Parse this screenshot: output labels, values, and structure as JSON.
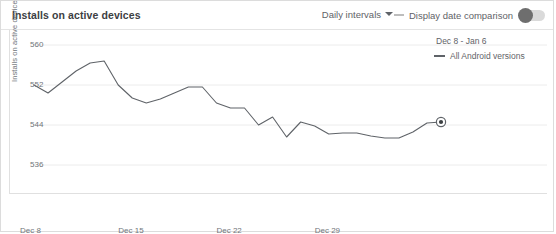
{
  "header": {
    "title": "Installs on active devices",
    "interval_label": "Daily intervals",
    "interval_icon": "chevron-down-icon",
    "comparison_label": "Display date comparison",
    "comparison_toggle_state": "off"
  },
  "legend": {
    "date_range": "Dec 8 - Jan 6",
    "series_label": "All Android versions",
    "series_color": "#5f6368"
  },
  "chart_data": {
    "type": "line",
    "title": "Installs on active devices",
    "xlabel": "",
    "ylabel": "Installs on active devices",
    "ylim": [
      532,
      562
    ],
    "yticks": [
      536,
      544,
      552,
      560
    ],
    "ytick_labels": [
      "536",
      "544",
      "552",
      "560"
    ],
    "xticks": [
      "Dec 8",
      "Dec 15",
      "Dec 22",
      "Dec 29"
    ],
    "xtick_positions": [
      0,
      7,
      14,
      21
    ],
    "grid": true,
    "legend_position": "top-right",
    "line_color": "#5f6368",
    "x": [
      "Dec 8",
      "Dec 9",
      "Dec 10",
      "Dec 11",
      "Dec 12",
      "Dec 13",
      "Dec 14",
      "Dec 15",
      "Dec 16",
      "Dec 17",
      "Dec 18",
      "Dec 19",
      "Dec 20",
      "Dec 21",
      "Dec 22",
      "Dec 23",
      "Dec 24",
      "Dec 25",
      "Dec 26",
      "Dec 27",
      "Dec 28",
      "Dec 29",
      "Dec 30",
      "Dec 31",
      "Jan 1",
      "Jan 2",
      "Jan 3",
      "Jan 4",
      "Jan 5",
      "Jan 6"
    ],
    "series": [
      {
        "name": "All Android versions",
        "values": [
          552.0,
          550.4,
          552.6,
          554.8,
          556.4,
          556.8,
          552.0,
          549.4,
          548.4,
          549.2,
          550.4,
          551.6,
          551.6,
          548.4,
          547.4,
          547.4,
          544.0,
          545.6,
          541.6,
          544.6,
          543.8,
          542.2,
          542.4,
          542.4,
          541.8,
          541.4,
          541.4,
          542.6,
          544.4,
          544.6
        ]
      }
    ],
    "endpoint_marker": {
      "x": "Jan 6",
      "y": 544.6,
      "style": "ringed-dot"
    }
  }
}
